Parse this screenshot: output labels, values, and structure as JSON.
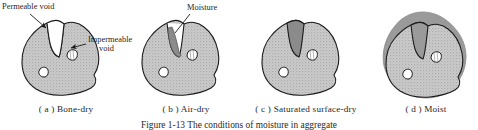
{
  "figure": {
    "number": "Figure 1-13",
    "caption_text": "Figure 1-13  The conditions of moisture in aggregate",
    "caption_visible_fragment": "Figure 1-13   The conditions of ..."
  },
  "callouts": [
    {
      "id": "permeable-void",
      "label": "Permeable void",
      "x": 2,
      "y": 3
    },
    {
      "id": "impermeable-void",
      "label_line1": "Impermeable",
      "label_line2": "void",
      "x": 88,
      "y": 36
    },
    {
      "id": "moisture",
      "label": "Moisture",
      "x": 186,
      "y": 4
    }
  ],
  "panels": [
    {
      "key": "a",
      "index_label": "( a )",
      "caption": "Bone-dry",
      "caption_full": "( a )  Bone-dry",
      "state": "bone-dry",
      "notch_fill": "none",
      "coating": false,
      "voids_white": 2
    },
    {
      "key": "b",
      "index_label": "( b )",
      "caption": "Air-dry",
      "caption_full": "( b )  Air-dry",
      "state": "air-dry",
      "notch_fill": "partial",
      "coating": false,
      "voids_white": 2
    },
    {
      "key": "c",
      "index_label": "( c )",
      "caption": "Saturated surface-dry",
      "caption_full": "( c )  Saturated surface-dry",
      "state": "saturated-surface-dry",
      "notch_fill": "full",
      "coating": false,
      "voids_white": 2
    },
    {
      "key": "d",
      "index_label": "( d )",
      "caption": "Moist",
      "caption_full": "( d )  Moist",
      "state": "moist",
      "notch_fill": "full",
      "coating": true,
      "voids_white": 2
    }
  ],
  "colors": {
    "aggregate_fill": "#c9c9c9",
    "aggregate_stipple": "#a6a6a6",
    "moisture_dark": "#848484",
    "coating_gray": "#9a9a9a",
    "void_white": "#ffffff",
    "outline": "#1a1a1a",
    "text": "#1f1f1f",
    "background": "#ffffff"
  }
}
